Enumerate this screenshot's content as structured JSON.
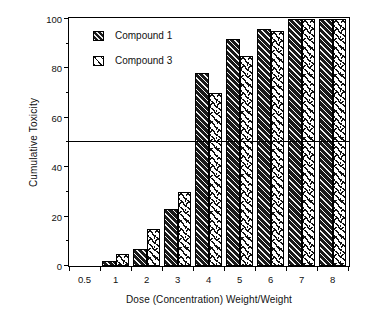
{
  "chart_data": {
    "type": "bar",
    "title": "",
    "xlabel": "Dose (Concentration) Weight/Weight",
    "ylabel": "Cumulative Toxicity",
    "categories": [
      "0.5",
      "1",
      "2",
      "3",
      "4",
      "5",
      "6",
      "7",
      "8"
    ],
    "series": [
      {
        "name": "Compound 1",
        "values": [
          0,
          2,
          7,
          23,
          78,
          92,
          96,
          100,
          100
        ],
        "fill": "dark-diagonal-hatch",
        "color": "#1a1a1a"
      },
      {
        "name": "Compound 3",
        "values": [
          0,
          5,
          15,
          30,
          70,
          85,
          95,
          100,
          100
        ],
        "fill": "light-dash-hatch",
        "color": "#ffffff"
      }
    ],
    "ylim": [
      0,
      100
    ],
    "yticks": [
      0,
      20,
      40,
      60,
      80,
      100
    ],
    "yticks_minor": [
      10,
      30,
      50,
      70,
      90
    ],
    "ytick_labels": [
      "0",
      "20",
      "40",
      "60",
      "80",
      "100"
    ],
    "xtick_labels": [
      "0.5",
      "1",
      "2",
      "3",
      "4",
      "5",
      "6",
      "7",
      "8"
    ],
    "grid": false,
    "legend_position": "upper-left-inside",
    "annotations": [
      {
        "type": "horizontal-reference-line",
        "value": 50,
        "label": ""
      }
    ]
  },
  "legend": {
    "items": [
      {
        "label": "Compound 1",
        "swatch": "compound-1-swatch"
      },
      {
        "label": "Compound 3",
        "swatch": "compound-3-swatch"
      }
    ]
  },
  "axes": {
    "y_title": "Cumulative Toxicity",
    "x_title": "Dose (Concentration) Weight/Weight"
  }
}
